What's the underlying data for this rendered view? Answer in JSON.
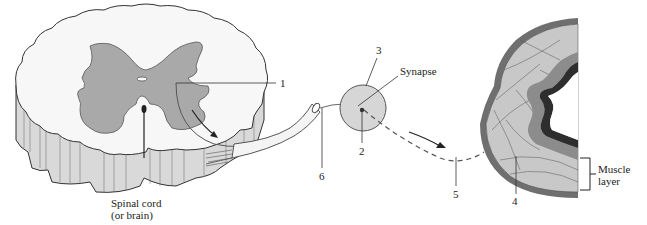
{
  "diagram": {
    "colors": {
      "gray_matter": "#a9a9a9",
      "white_matter": "#f7f7f7",
      "cord_side": "#d9d9d9",
      "synapse_fill": "#d6d6d6",
      "muscle_fill": "#c8c8c8",
      "muscle_outer": "#6f6f6f",
      "mucosa_dark": "#2e2e2e",
      "line": "#333333"
    },
    "labels": {
      "spinal_cord": "Spinal cord\n(or brain)",
      "num_1": "1",
      "num_2": "2",
      "num_3": "3",
      "num_4": "4",
      "num_5": "5",
      "num_6": "6",
      "synapse": "Synapse",
      "muscle_layer": "Muscle\nlayer"
    }
  }
}
